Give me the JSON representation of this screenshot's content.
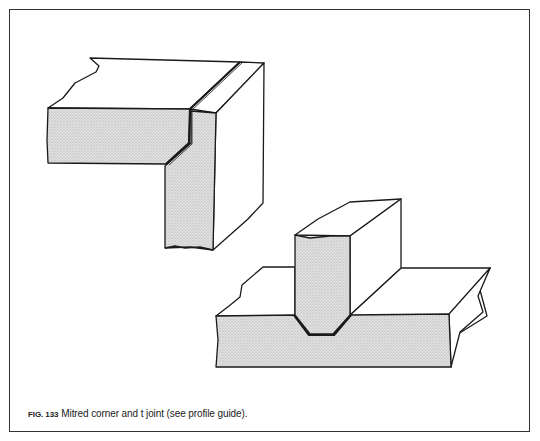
{
  "figure": {
    "number": "FIG. 133",
    "caption": "Mitred corner and t joint (see profile guide).",
    "colors": {
      "outline": "#1a1a1a",
      "end_grain_fill": "#d4d4d4",
      "face_fill": "#ffffff",
      "frame": "#333333"
    },
    "parts": [
      {
        "id": "mitred-corner",
        "label": "Mitred corner"
      },
      {
        "id": "t-joint",
        "label": "t joint"
      }
    ]
  }
}
